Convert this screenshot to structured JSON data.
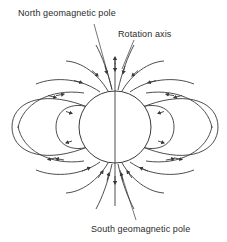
{
  "figure": {
    "background_color": "#ffffff",
    "line_color": "#3a3a3a",
    "text_color": "#2b2b2b"
  },
  "labels": {
    "north_pole": "North geomagnetic pole",
    "rotation_axis": "Rotation axis",
    "south_pole": "South geomagnetic pole"
  },
  "diagram_data": {
    "type": "diagram",
    "subject": "geomagnetic dipole field of the Earth",
    "earth": {
      "shape": "circle",
      "center_x": 115,
      "center_y": 127,
      "radius": 36,
      "fill": "none",
      "stroke": "#3a3a3a"
    },
    "rotation_axis": {
      "orientation": "vertical",
      "x": 115,
      "y_top": 57,
      "y_bottom": 206,
      "arrow_heads": [
        "up-at-top",
        "down-at-bottom"
      ],
      "mid_arrow_y": 70
    },
    "closed_loops": [
      {
        "side": "left",
        "type": "outer",
        "cx": 72,
        "cy": 127,
        "rx": 62,
        "ry": 42
      },
      {
        "side": "left",
        "type": "inner",
        "cx": 96,
        "cy": 127,
        "rx": 32,
        "ry": 26
      },
      {
        "side": "right",
        "type": "outer",
        "cx": 158,
        "cy": 127,
        "rx": 62,
        "ry": 42
      },
      {
        "side": "right",
        "type": "inner",
        "cx": 134,
        "cy": 127,
        "rx": 32,
        "ry": 26
      }
    ],
    "open_field_lines": {
      "count_per_quadrant": 4,
      "converge_at": [
        "north geomagnetic pole",
        "south geomagnetic pole"
      ],
      "arrow_direction": "toward the poles",
      "arrowheads_per_line": 1
    },
    "leader_lines": [
      {
        "label": "north_pole",
        "from_x": 94,
        "from_y": 24,
        "to_x": 112,
        "to_y": 89
      },
      {
        "label": "rotation_axis",
        "from_x": 134,
        "from_y": 40,
        "to_x": 122,
        "to_y": 69
      },
      {
        "label": "south_pole",
        "from_x": 136,
        "from_y": 220,
        "to_x": 120,
        "to_y": 170
      }
    ]
  }
}
